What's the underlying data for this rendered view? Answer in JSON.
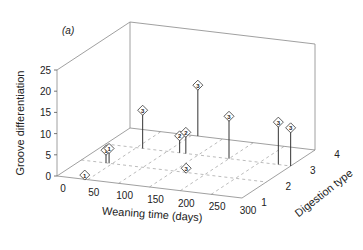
{
  "chart_data": {
    "type": "scatter3d",
    "panel_label": "(a)",
    "title": "",
    "xlabel": "Weaning time (days)",
    "ylabel": "Digestion type",
    "zlabel": "Groove differentiation",
    "xticks": [
      "0",
      "50",
      "100",
      "150",
      "200",
      "250",
      "300"
    ],
    "yticks": [
      "1",
      "2",
      "3",
      "4"
    ],
    "zticks": [
      "0",
      "5",
      "10",
      "15",
      "20",
      "25"
    ],
    "xlim": [
      0,
      300
    ],
    "ylim": [
      1,
      4
    ],
    "zlim": [
      0,
      25
    ],
    "grid": true,
    "marker": "diamond labeled with digestion type",
    "points": [
      {
        "x": 45,
        "y": 1,
        "z": 1,
        "label": "1"
      },
      {
        "x": 40,
        "y": 2,
        "z": 3,
        "label": "1"
      },
      {
        "x": 45,
        "y": 2,
        "z": 3.5,
        "label": "1"
      },
      {
        "x": 60,
        "y": 3,
        "z": 9,
        "label": "3"
      },
      {
        "x": 120,
        "y": 3,
        "z": 4,
        "label": "2"
      },
      {
        "x": 130,
        "y": 3,
        "z": 5,
        "label": "2"
      },
      {
        "x": 110,
        "y": 4,
        "z": 12,
        "label": "3"
      },
      {
        "x": 170,
        "y": 2,
        "z": 1,
        "label": "3"
      },
      {
        "x": 200,
        "y": 3,
        "z": 10,
        "label": "3"
      },
      {
        "x": 280,
        "y": 3,
        "z": 10,
        "label": "3"
      },
      {
        "x": 300,
        "y": 3,
        "z": 9,
        "label": "3"
      }
    ]
  }
}
